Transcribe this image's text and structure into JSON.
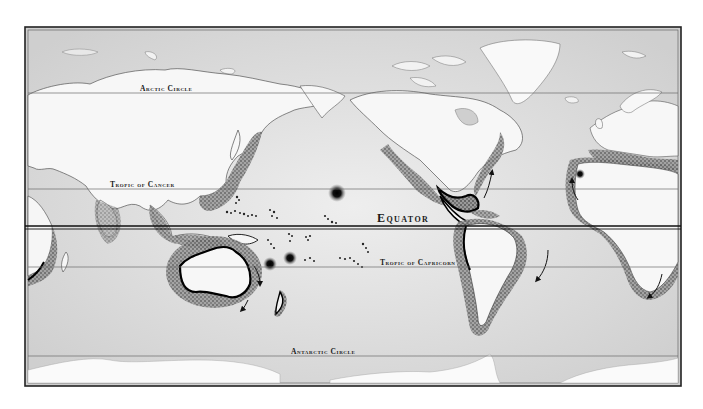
{
  "map": {
    "projection": "Pacific-centered world map",
    "style": "engraved grayscale relief",
    "frame": {
      "x": 25,
      "y": 27,
      "width": 656,
      "height": 359
    },
    "colors": {
      "ocean": "#dcdcdc",
      "ocean_light": "#ececec",
      "land": "#f6f6f6",
      "coast_line": "#111111",
      "stipple": "#2a2a2a",
      "frame": "#222222",
      "line": "#6a6a6a"
    },
    "lines": {
      "arctic_circle": {
        "label": "Arctic Circle",
        "y": 93
      },
      "tropic_of_cancer": {
        "label": "Tropic of Cancer",
        "y": 189
      },
      "equator": {
        "label": "Equator",
        "y": 227
      },
      "tropic_of_capricorn": {
        "label": "Tropic of Capricorn",
        "y": 267
      },
      "antarctic_circle": {
        "label": "Antarctic Circle",
        "y": 356
      }
    },
    "labels": {
      "arctic": "Arctic Circle",
      "cancer": "Tropic of Cancer",
      "equator": "Equator",
      "capricorn": "Tropic of Capricorn",
      "antarctic": "Antarctic Circle"
    },
    "regions": [
      "Asia",
      "Europe",
      "Africa",
      "Australia",
      "New Zealand",
      "North America",
      "South America",
      "Greenland",
      "Antarctica",
      "Pacific Islands"
    ],
    "markers": [
      {
        "type": "starburst",
        "x": 337,
        "y": 193
      },
      {
        "type": "starburst",
        "x": 290,
        "y": 258
      },
      {
        "type": "starburst",
        "x": 270,
        "y": 264
      },
      {
        "type": "starburst",
        "x": 580,
        "y": 174
      },
      {
        "type": "starburst",
        "x": 553,
        "y": 148
      }
    ],
    "arrows": [
      {
        "from": [
          488,
          186
        ],
        "to": [
          493,
          171
        ]
      },
      {
        "from": [
          540,
          276
        ],
        "to": [
          537,
          280
        ]
      },
      {
        "from": [
          655,
          277
        ],
        "to": [
          650,
          294
        ]
      },
      {
        "from": [
          578,
          180
        ],
        "to": [
          570,
          200
        ]
      },
      {
        "from": [
          257,
          269
        ],
        "to": [
          262,
          281
        ]
      },
      {
        "from": [
          246,
          306
        ],
        "to": [
          244,
          310
        ]
      }
    ]
  }
}
